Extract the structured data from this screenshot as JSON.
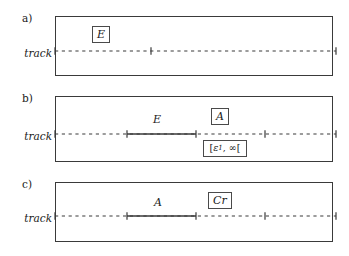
{
  "figure": {
    "background_color": "#ffffff",
    "line_color": "#3a3a3a",
    "text_color": "#1a1a1a",
    "panels": [
      {
        "id": "a",
        "label": "a)",
        "track_label": "track",
        "boxed_symbols": [
          {
            "name": "event-box-e",
            "text": "E"
          }
        ],
        "segment_labels": [],
        "track": {
          "style": "dashed",
          "tick_positions_px": [
            0,
            96,
            281
          ],
          "solid_segment": null
        }
      },
      {
        "id": "b",
        "label": "b)",
        "track_label": "track",
        "boxed_symbols": [
          {
            "name": "action-box-a",
            "text": "A"
          },
          {
            "name": "interval-box",
            "text": "[ε1, ∞[",
            "open": "[",
            "close": "[",
            "lower": "ε",
            "lower_sub": "1",
            "upper": "∞"
          }
        ],
        "segment_labels": [
          {
            "name": "segment-label-e",
            "text": "E"
          }
        ],
        "track": {
          "style": "dashed",
          "tick_positions_px": [
            0,
            72,
            141,
            210,
            281
          ],
          "solid_segment": {
            "start_px": 72,
            "end_px": 141
          }
        }
      },
      {
        "id": "c",
        "label": "c)",
        "track_label": "track",
        "boxed_symbols": [
          {
            "name": "constraint-box-cr",
            "text": "Cr"
          }
        ],
        "segment_labels": [
          {
            "name": "segment-label-a",
            "text": "A"
          }
        ],
        "track": {
          "style": "dashed",
          "tick_positions_px": [
            0,
            72,
            141,
            210,
            281
          ],
          "solid_segment": {
            "start_px": 72,
            "end_px": 141
          }
        }
      }
    ]
  }
}
